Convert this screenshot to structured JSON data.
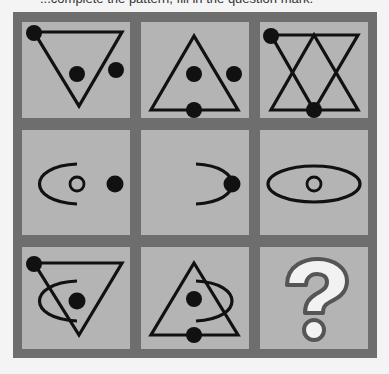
{
  "prompt": {
    "text": "...complete the pattern, fill in the question mark."
  },
  "puzzle": {
    "type": "3x3 visual matrix",
    "colors": {
      "background": "#f4f4f4",
      "grid_frame": "#6e6e6e",
      "cell_fill": "#b4b4b4",
      "stroke": "#111111",
      "question_fill": "#f2f2f2",
      "question_outline": "#555555"
    },
    "cells": [
      {
        "row": 1,
        "col": 1,
        "description": "inverted triangle, dot at top-left vertex, dot inside, dot outside right"
      },
      {
        "row": 1,
        "col": 2,
        "description": "upright triangle, dot inside, dot outside right, dot on bottom edge"
      },
      {
        "row": 1,
        "col": 3,
        "description": "overlapping upright and inverted triangles (hexagram), dot top-left vertex, dot bottom center"
      },
      {
        "row": 2,
        "col": 1,
        "description": "left half ellipse arc, small circle, dot outside right"
      },
      {
        "row": 2,
        "col": 2,
        "description": "right half ellipse arc with dot at right end"
      },
      {
        "row": 2,
        "col": 3,
        "description": "full ellipse with small circle inside"
      },
      {
        "row": 3,
        "col": 1,
        "description": "inverted triangle with dot at top-left vertex, left arc, dot inside"
      },
      {
        "row": 3,
        "col": 2,
        "description": "upright triangle with right arc, dot inside, dot on bottom edge"
      },
      {
        "row": 3,
        "col": 3,
        "description": "question mark",
        "symbol": "?"
      }
    ]
  }
}
